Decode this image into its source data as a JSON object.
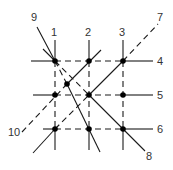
{
  "diagram": {
    "title": "",
    "labels": [
      {
        "id": "1",
        "text": "1",
        "x": 51,
        "y": 36
      },
      {
        "id": "2",
        "text": "2",
        "x": 85,
        "y": 36
      },
      {
        "id": "3",
        "text": "3",
        "x": 119,
        "y": 36
      },
      {
        "id": "4",
        "text": "4",
        "x": 157,
        "y": 65
      },
      {
        "id": "5",
        "text": "5",
        "x": 157,
        "y": 99
      },
      {
        "id": "6",
        "text": "6",
        "x": 157,
        "y": 133
      },
      {
        "id": "7",
        "text": "7",
        "x": 157,
        "y": 21
      },
      {
        "id": "8",
        "text": "8",
        "x": 146,
        "y": 160
      },
      {
        "id": "9",
        "text": "9",
        "x": 31,
        "y": 21
      },
      {
        "id": "10",
        "text": "10",
        "x": 8,
        "y": 136
      }
    ],
    "nodes": [
      {
        "x": 55,
        "y": 61
      },
      {
        "x": 89,
        "y": 61
      },
      {
        "x": 123,
        "y": 61
      },
      {
        "x": 55,
        "y": 95
      },
      {
        "x": 89,
        "y": 95
      },
      {
        "x": 123,
        "y": 95
      },
      {
        "x": 55,
        "y": 129
      },
      {
        "x": 89,
        "y": 129
      },
      {
        "x": 123,
        "y": 129
      },
      {
        "x": 67,
        "y": 84
      }
    ]
  }
}
